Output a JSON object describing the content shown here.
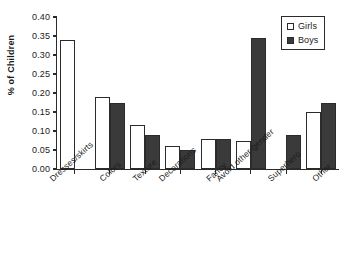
{
  "chart_data": {
    "type": "bar",
    "title": "",
    "xlabel": "",
    "ylabel": "% of Children",
    "ylim": [
      0.0,
      0.4
    ],
    "ytick_labels": [
      "0.40",
      "0.35",
      "0.30",
      "0.25",
      "0.20",
      "0.15",
      "0.10",
      "0.05",
      "0.00"
    ],
    "ytick_values": [
      0.4,
      0.35,
      0.3,
      0.25,
      0.2,
      0.15,
      0.1,
      0.05,
      0.0
    ],
    "grid": false,
    "legend_position": "top-right",
    "categories": [
      "Dresses/skirts",
      "Colors",
      "Texture",
      "Decorations",
      "Fancy",
      "Avoid other-gender",
      "Superhero",
      "Other"
    ],
    "series": [
      {
        "name": "Girls",
        "color": "#ffffff",
        "values": [
          0.34,
          0.19,
          0.115,
          0.06,
          0.08,
          0.075,
          0.0,
          0.15
        ]
      },
      {
        "name": "Boys",
        "color": "#3a3a3a",
        "values": [
          0.0,
          0.175,
          0.09,
          0.05,
          0.08,
          0.345,
          0.09,
          0.175
        ]
      }
    ]
  },
  "legend": {
    "items": [
      {
        "label": "Girls",
        "swatch": "open-square"
      },
      {
        "label": "Boys",
        "swatch": "filled-square"
      }
    ]
  },
  "caption": {
    "text": ""
  }
}
